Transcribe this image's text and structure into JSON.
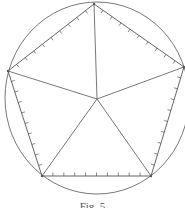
{
  "figure": {
    "caption": "Fig. 5",
    "stroke_color": "#555555",
    "circle": {
      "cx": 97,
      "cy": 98,
      "rx": 92,
      "ry": 96
    },
    "center": [
      97,
      99
    ],
    "vertices": [
      [
        94,
        4
      ],
      [
        184,
        67
      ],
      [
        151,
        176
      ],
      [
        42,
        176
      ],
      [
        8,
        71
      ]
    ],
    "ticks_per_side": 10
  }
}
